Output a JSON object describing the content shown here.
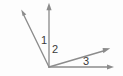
{
  "figure": {
    "type": "geometry-diagram",
    "background_color": "#fdfdfd",
    "line_color": "#8c8c8c",
    "label_color": "#3a3a3a",
    "width": 123,
    "height": 76,
    "vertex": {
      "name": "common-vertex",
      "x": 49,
      "y": 67
    },
    "rays": [
      {
        "id": "ray-upper-left",
        "from_x": 49,
        "from_y": 67,
        "to_x": 22,
        "to_y": 12,
        "arrow": true
      },
      {
        "id": "ray-vertical",
        "from_x": 49,
        "from_y": 67,
        "to_x": 49,
        "to_y": 5,
        "arrow": true
      },
      {
        "id": "ray-diagonal-right",
        "from_x": 49,
        "from_y": 67,
        "to_x": 109,
        "to_y": 49,
        "arrow": true
      },
      {
        "id": "ray-horizontal",
        "from_x": 49,
        "from_y": 67,
        "to_x": 113,
        "to_y": 67,
        "arrow": true
      }
    ],
    "angles": [
      {
        "id": "angle-1",
        "label": "1",
        "between": [
          "ray-upper-left",
          "ray-vertical"
        ],
        "label_x": 41,
        "label_y": 35
      },
      {
        "id": "angle-2",
        "label": "2",
        "between": [
          "ray-vertical",
          "ray-diagonal-right"
        ],
        "label_x": 52,
        "label_y": 44
      },
      {
        "id": "angle-3",
        "label": "3",
        "between": [
          "ray-diagonal-right",
          "ray-horizontal"
        ],
        "label_x": 83,
        "label_y": 56
      }
    ]
  }
}
